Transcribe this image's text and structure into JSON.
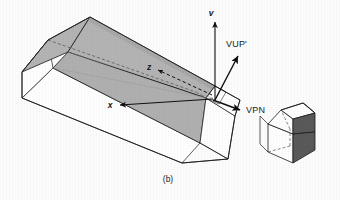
{
  "figure": {
    "caption": "(b)",
    "kind": "perspective-view-volume-diagram",
    "background_color": "#fdfdfd"
  },
  "colors": {
    "outline": "#1b1b1b",
    "face_shaded": "#b4b4b4",
    "face_shaded_dark": "#a2a2a2",
    "face_light": "#ffffff",
    "house_dark_face": "#5a5a5a",
    "house_mid_face": "#8c8c8c",
    "label_text": "#1b1b1b",
    "dashed_line": "#3a3a3a"
  },
  "labels": {
    "axis_v": "v",
    "axis_x": "x",
    "axis_z": "z",
    "vector_vup": "VUP'",
    "vector_vpn": "VPN"
  },
  "axes": [
    {
      "name": "v",
      "label": "v",
      "style": "solid",
      "direction": "up",
      "tip": [
        215,
        18
      ],
      "origin": [
        215,
        100
      ]
    },
    {
      "name": "x",
      "label": "x",
      "style": "solid",
      "direction": "left",
      "tip": [
        116,
        106
      ],
      "origin": [
        215,
        100
      ]
    },
    {
      "name": "z",
      "label": "z",
      "style": "dashed",
      "direction": "upper-left",
      "tip": [
        154,
        68
      ],
      "origin": [
        215,
        100
      ]
    }
  ],
  "vectors": [
    {
      "name": "VUP'",
      "label": "VUP'",
      "style": "solid",
      "direction": "up-right",
      "tip": [
        240,
        52
      ],
      "origin": [
        215,
        100
      ]
    },
    {
      "name": "VPN",
      "label": "VPN",
      "style": "solid",
      "direction": "down-right",
      "tip": [
        244,
        112
      ],
      "origin": [
        215,
        100
      ]
    }
  ],
  "objects": {
    "view_volume": {
      "name": "view-volume-frustum",
      "description": "long rectangular prism / frustum converging toward the eye point at right",
      "shaded": true
    },
    "house": {
      "name": "house-object",
      "description": "small gabled house solid with dark shaded right face",
      "shaded": true
    }
  }
}
